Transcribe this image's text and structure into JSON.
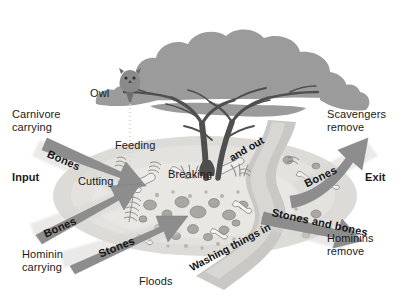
{
  "figure": {
    "type": "diagram"
  },
  "labels": {
    "input": "Input",
    "exit": "Exit",
    "owl": "Owl",
    "carnivore_carrying": "Carnivore\ncarrying",
    "hominin_carrying": "Hominin\ncarrying",
    "scavengers_remove": "Scavengers\nremove",
    "hominins_remove": "Hominins\nremove",
    "floods": "Floods",
    "feeding": "Feeding",
    "cutting": "Cutting",
    "breaking": "Breaking"
  },
  "arrows": [
    {
      "id": "carnivore-bones-in",
      "label": "Bones",
      "direction": "in",
      "from": "upper-left",
      "to": "site"
    },
    {
      "id": "hominin-bones-in",
      "label": "Bones",
      "direction": "in",
      "from": "lower-left",
      "to": "site"
    },
    {
      "id": "hominin-stones-in",
      "label": "Stones",
      "direction": "in",
      "from": "lower-left",
      "to": "site"
    },
    {
      "id": "scavengers-bones-out",
      "label": "Bones",
      "direction": "out",
      "from": "site",
      "to": "upper-right"
    },
    {
      "id": "hominins-stones-bones-out",
      "label": "Stones and bones",
      "direction": "out",
      "from": "site",
      "to": "lower-right"
    }
  ],
  "river": {
    "label_part1": "Washing things in",
    "label_part2": "and out"
  },
  "colors": {
    "arrow_fill": "#8d8d8d",
    "arrow_halo": "#d3d3d3",
    "site_fill": "#d8d7d4",
    "site_inner": "#e2e1de",
    "river_fill": "#c4c4c4",
    "tree_canopy": "#9a9a9a",
    "tree_trunk": "#4f4f4f",
    "stone_fill": "#a8a5a2",
    "bone_fill": "#f2f1ef",
    "text": "#1a1a1a",
    "background": "#ffffff"
  }
}
